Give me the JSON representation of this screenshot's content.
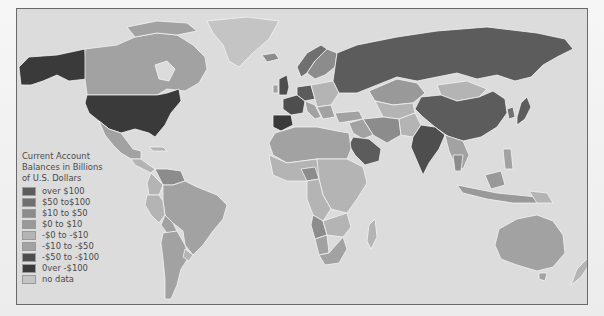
{
  "map": {
    "title": "Current Account Balances in Billions of U.S. Dollars",
    "ocean_color": "#dcdcdc",
    "border_color": "#6a6a6a"
  },
  "legend": {
    "title_lines": [
      "Current Account",
      "Balances in Billions",
      "of U.S. Dollars"
    ],
    "items": [
      {
        "label": "over $100",
        "color": "#5c5c5c"
      },
      {
        "label": "$50 to$100",
        "color": "#707070"
      },
      {
        "label": "$10 to $50",
        "color": "#8c8c8c"
      },
      {
        "label": "$0 to $10",
        "color": "#999999"
      },
      {
        "label": "-$0 to -$10",
        "color": "#b4b4b4"
      },
      {
        "label": "-$10 to -$50",
        "color": "#a2a2a2"
      },
      {
        "label": "-$50 to -$100",
        "color": "#4e4e4e"
      },
      {
        "label": "0ver -$100",
        "color": "#3a3a3a"
      },
      {
        "label": "no data",
        "color": "#c4c4c4"
      }
    ]
  },
  "regions": {
    "usa": "0ver -$100",
    "canada": "-$10 to -$50",
    "alaska": "0ver -$100",
    "greenland": "no data",
    "mexico": "-$10 to -$50",
    "brazil": "-$10 to -$50",
    "russia": "over $100",
    "china": "over $100",
    "india": "-$50 to -$100",
    "australia": "-$10 to -$50",
    "saudi_arabia": "over $100",
    "japan": "over $100",
    "uk": "-$50 to -$100",
    "spain": "0ver -$100",
    "france": "-$50 to -$100",
    "germany": "over $100",
    "argentina": "-$10 to -$50",
    "africa_general": "-$0 to -$10",
    "nigeria": "$10 to $50",
    "angola": "$10 to $50",
    "south_africa": "-$10 to -$50",
    "kazakhstan": "$0 to $10",
    "mongolia": "-$0 to -$10",
    "indonesia": "$0 to $10",
    "iran": "$10 to $50",
    "turkey": "-$10 to -$50",
    "new_zealand": "-$0 to -$10",
    "madagascar": "-$0 to -$10",
    "norway": "$50 to$100",
    "venezuela": "$10 to $50"
  }
}
